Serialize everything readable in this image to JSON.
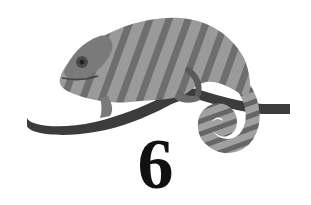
{
  "chapter": {
    "number": "6"
  },
  "illustration": {
    "subject": "chameleon-on-branch",
    "palette": {
      "body_light": "#9a9a9a",
      "body_mid": "#7a7a7a",
      "body_dark": "#4a4a4a",
      "branch": "#3c3c3c",
      "ink": "#111111",
      "background": "#ffffff"
    }
  }
}
